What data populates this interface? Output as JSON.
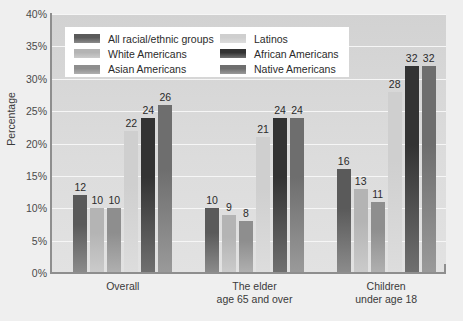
{
  "chart_data": {
    "type": "bar",
    "title": "",
    "subtitle": "",
    "xlabel": "",
    "ylabel": "Percentage",
    "ylim": [
      0,
      40
    ],
    "ytick_labels": [
      "40%",
      "35%",
      "30%",
      "25%",
      "20%",
      "15%",
      "10%",
      "5%",
      "0%"
    ],
    "ytick_values": [
      40,
      35,
      30,
      25,
      20,
      15,
      10,
      5,
      0
    ],
    "grid": true,
    "legend_position": "top-left-inside",
    "categories": [
      "Overall",
      "The elder\nage 65 and over",
      "Children\nunder age 18"
    ],
    "category_lines": [
      [
        "Overall"
      ],
      [
        "The elder",
        "age 65 and over"
      ],
      [
        "Children",
        "under age 18"
      ]
    ],
    "series": [
      {
        "name": "All racial/ethnic groups",
        "color": "#5a5a5a",
        "values": [
          12,
          10,
          16
        ]
      },
      {
        "name": "White Americans",
        "color": "#b4b4b4",
        "values": [
          10,
          9,
          13
        ]
      },
      {
        "name": "Asian Americans",
        "color": "#8e8e8e",
        "values": [
          10,
          8,
          11
        ]
      },
      {
        "name": "Latinos",
        "color": "#cfcfcf",
        "values": [
          22,
          21,
          28
        ]
      },
      {
        "name": "African Americans",
        "color": "#333333",
        "values": [
          24,
          24,
          32
        ]
      },
      {
        "name": "Native Americans",
        "color": "#6e6e6e",
        "values": [
          26,
          24,
          32
        ]
      }
    ]
  },
  "colors": {
    "canvas_background": "#efefef",
    "plot_background": "#d8d8d8",
    "gridline": "#f6f6f6",
    "axis": "#8e8e8e",
    "legend_background": "#ffffff",
    "text": "#2b2b2b"
  }
}
